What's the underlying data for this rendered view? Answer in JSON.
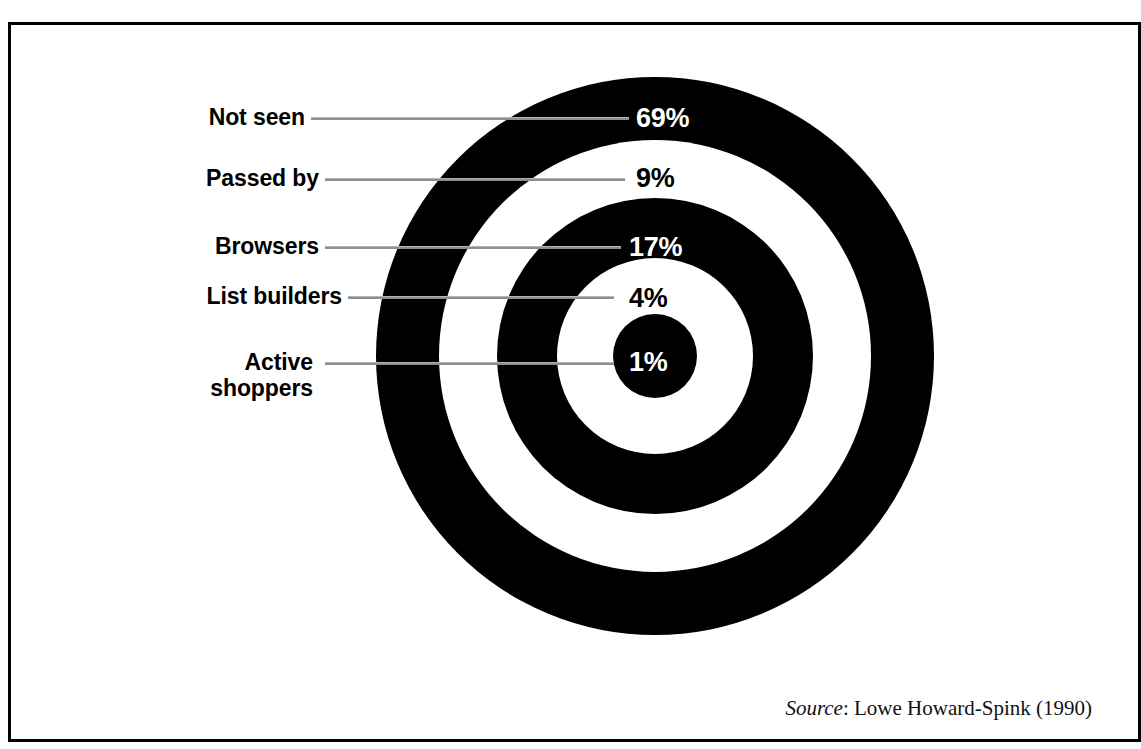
{
  "figure": {
    "title_sliver": "Figure: the shopper funnel — penetration by engagement stage",
    "frame_color": "#000000",
    "background_color": "#ffffff",
    "ring_dark_color": "#000000",
    "ring_light_color": "#ffffff",
    "leader_line_color": "#8e8e8e"
  },
  "source": {
    "label": "Source",
    "separator": ": ",
    "text": "Lowe Howard-Spink (1990)"
  },
  "chart_data": {
    "type": "pie",
    "subtype": "concentric-target-rings",
    "title": "",
    "xlabel": "",
    "ylabel": "",
    "categories": [
      "Not seen",
      "Passed by",
      "Browsers",
      "List builders",
      "Active shoppers"
    ],
    "values": [
      69,
      9,
      17,
      4,
      1
    ],
    "value_labels": [
      "69%",
      "9%",
      "17%",
      "4%",
      "1%"
    ],
    "units": "percent",
    "total": 100,
    "legend_position": "left-with-leader-lines",
    "grid": false,
    "series": [
      {
        "name": "Share of shoppers",
        "values": [
          69,
          9,
          17,
          4,
          1
        ]
      }
    ],
    "rings": [
      {
        "index": 0,
        "category": "Not seen",
        "value": 69,
        "value_label": "69%",
        "fill": "#000000",
        "text_color": "#ffffff"
      },
      {
        "index": 1,
        "category": "Passed by",
        "value": 9,
        "value_label": "9%",
        "fill": "#ffffff",
        "text_color": "#000000"
      },
      {
        "index": 2,
        "category": "Browsers",
        "value": 17,
        "value_label": "17%",
        "fill": "#000000",
        "text_color": "#ffffff"
      },
      {
        "index": 3,
        "category": "List builders",
        "value": 4,
        "value_label": "4%",
        "fill": "#ffffff",
        "text_color": "#000000"
      },
      {
        "index": 4,
        "category": "Active shoppers",
        "value": 1,
        "value_label": "1%",
        "fill": "#000000",
        "text_color": "#ffffff"
      }
    ]
  },
  "labels": {
    "not_seen": "Not seen",
    "passed_by": "Passed by",
    "browsers": "Browsers",
    "list_builders": "List builders",
    "active_shoppers": "Active\nshoppers"
  },
  "percents": {
    "not_seen": "69%",
    "passed_by": "9%",
    "browsers": "17%",
    "list_builders": "4%",
    "active_shoppers": "1%"
  }
}
